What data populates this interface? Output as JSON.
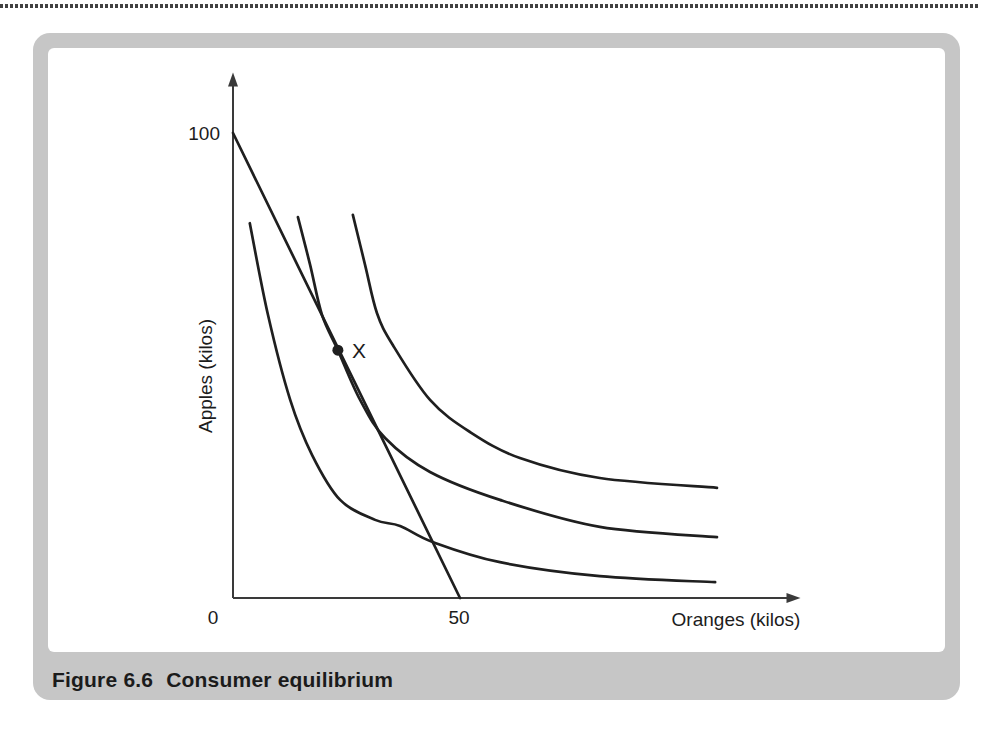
{
  "figure": {
    "label": "Figure 6.6",
    "title": "Consumer equilibrium"
  },
  "colors": {
    "line": "#1f1f1f",
    "axis": "#3a3a3a",
    "frame": "#c6c6c6",
    "text": "#1c1c1c",
    "dotted_rule": "#414141",
    "background": "#ffffff"
  },
  "chart_data": {
    "type": "line",
    "title": "Figure 6.6 Consumer equilibrium",
    "xlabel": "Oranges (kilos)",
    "ylabel": "Apples (kilos)",
    "xlim": [
      0,
      125
    ],
    "ylim": [
      0,
      113
    ],
    "grid": false,
    "x_ticks": [
      {
        "value": 0,
        "label": "0"
      },
      {
        "value": 50,
        "label": "50"
      }
    ],
    "y_ticks": [
      {
        "value": 100,
        "label": "100"
      }
    ],
    "axes": {
      "origin_px": {
        "x": 233,
        "y": 598
      },
      "px_per_unit": {
        "x": 4.54,
        "y": 4.65
      },
      "x_arrow_at": 125,
      "y_arrow_at": 113
    },
    "series": [
      {
        "name": "budget-line",
        "type": "straight",
        "points": [
          [
            0,
            100
          ],
          [
            50,
            0
          ]
        ]
      },
      {
        "name": "indifference-curve-1",
        "type": "smooth",
        "points": [
          [
            3.7,
            80.6
          ],
          [
            7.7,
            60.9
          ],
          [
            12.6,
            42.6
          ],
          [
            17.4,
            30.8
          ],
          [
            23.6,
            21.1
          ],
          [
            31.3,
            16.8
          ],
          [
            36.8,
            15.5
          ],
          [
            44.1,
            12.0
          ],
          [
            58.8,
            7.7
          ],
          [
            80.8,
            4.7
          ],
          [
            106.2,
            3.4
          ]
        ]
      },
      {
        "name": "indifference-curve-2",
        "type": "smooth",
        "points": [
          [
            14.3,
            81.9
          ],
          [
            17.0,
            71.6
          ],
          [
            19.6,
            60.9
          ],
          [
            23.1,
            53.3
          ],
          [
            28.0,
            42.6
          ],
          [
            33.5,
            34.4
          ],
          [
            43.4,
            27.1
          ],
          [
            58.8,
            21.1
          ],
          [
            80.8,
            15.3
          ],
          [
            106.6,
            13.1
          ]
        ]
      },
      {
        "name": "indifference-curve-3",
        "type": "smooth",
        "points": [
          [
            26.4,
            82.4
          ],
          [
            29.1,
            71.6
          ],
          [
            31.7,
            61.3
          ],
          [
            35.2,
            54.4
          ],
          [
            43.4,
            42.6
          ],
          [
            52.2,
            35.7
          ],
          [
            63.2,
            30.1
          ],
          [
            80.8,
            25.8
          ],
          [
            106.6,
            23.7
          ]
        ]
      }
    ],
    "equilibrium_point": {
      "x": 23.1,
      "y": 53.3,
      "label": "X"
    }
  }
}
